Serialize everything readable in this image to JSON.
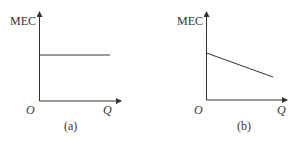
{
  "panels": [
    {
      "id": "a",
      "y_label": "MEC",
      "x_label": "Q",
      "origin_label": "O",
      "caption": "(a)",
      "curve": "horizontal"
    },
    {
      "id": "b",
      "y_label": "MEC",
      "x_label": "Q",
      "origin_label": "O",
      "caption": "(b)",
      "curve": "downward-sloping"
    }
  ],
  "colors": {
    "line": "#333333",
    "text": "#333333"
  }
}
